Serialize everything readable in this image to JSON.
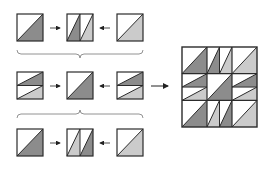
{
  "diagram": {
    "colors": {
      "dark": "#8c8c8c",
      "light": "#cbcbcb",
      "white": "#ffffff",
      "stroke": "#2b2b2b",
      "brace": "#777777",
      "arrow": "#222222"
    },
    "rows": [
      {
        "name": "row-top",
        "units": [
          {
            "type": "hst",
            "fill": "dark"
          },
          {
            "type": "vstrips",
            "fills": [
              "dark",
              "light"
            ]
          },
          {
            "type": "hst",
            "fill": "light"
          }
        ],
        "brace": "down"
      },
      {
        "name": "row-middle",
        "units": [
          {
            "type": "hstrips",
            "fills": [
              "dark",
              "light"
            ]
          },
          {
            "type": "hst",
            "fill": "dark"
          },
          {
            "type": "hstrips",
            "fills": [
              "dark",
              "light"
            ]
          }
        ]
      },
      {
        "name": "row-bottom",
        "units": [
          {
            "type": "hst",
            "fill": "dark"
          },
          {
            "type": "vstrips",
            "fills": [
              "light",
              "dark"
            ]
          },
          {
            "type": "hst",
            "fill": "light"
          }
        ],
        "brace": "up"
      }
    ],
    "result_block": {
      "grid": "3x3",
      "cells": [
        {
          "type": "hst",
          "fill": "dark"
        },
        {
          "type": "vstrips",
          "fills": [
            "dark",
            "light"
          ]
        },
        {
          "type": "hst",
          "fill": "light"
        },
        {
          "type": "hstrips",
          "fills": [
            "dark",
            "light"
          ]
        },
        {
          "type": "hst",
          "fill": "dark"
        },
        {
          "type": "hstrips",
          "fills": [
            "dark",
            "light"
          ]
        },
        {
          "type": "hst",
          "fill": "dark"
        },
        {
          "type": "vstrips",
          "fills": [
            "light",
            "dark"
          ]
        },
        {
          "type": "hst",
          "fill": "light"
        }
      ]
    }
  }
}
